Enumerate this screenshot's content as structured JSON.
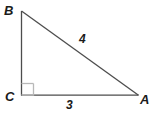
{
  "figure": {
    "type": "right-triangle",
    "colors": {
      "stroke": "#4d4d4d",
      "right_angle_mark": "#b3b3b3",
      "text": "#1a1a1a",
      "background": "#ffffff"
    },
    "vertices": [
      {
        "name": "B",
        "label": "B",
        "x": 21,
        "y": 11
      },
      {
        "name": "C",
        "label": "C",
        "x": 21,
        "y": 95
      },
      {
        "name": "A",
        "label": "A",
        "x": 138,
        "y": 95
      }
    ],
    "sides": [
      {
        "name": "hypotenuse-BA",
        "label": "4",
        "from": "B",
        "to": "A"
      },
      {
        "name": "base-CA",
        "label": "3",
        "from": "C",
        "to": "A"
      },
      {
        "name": "leg-BC",
        "label": "",
        "from": "B",
        "to": "C"
      }
    ],
    "right_angle": {
      "at_vertex": "C",
      "marker": "square"
    },
    "labels": {
      "vertex_a": "A",
      "vertex_b": "B",
      "vertex_c": "C",
      "side_hypotenuse": "4",
      "side_base": "3"
    }
  }
}
